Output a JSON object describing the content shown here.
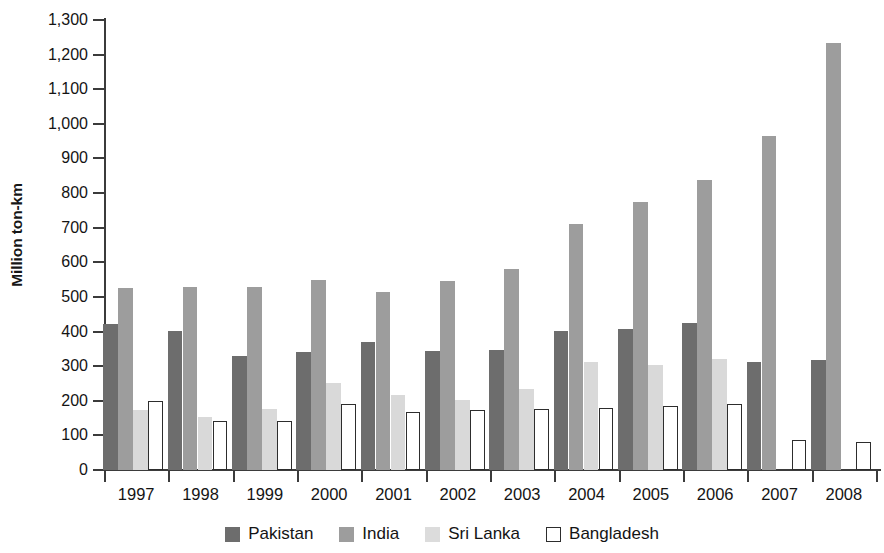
{
  "chart_data": {
    "type": "bar",
    "title": "",
    "subtitle": "",
    "xlabel": "",
    "ylabel": "Million ton-km",
    "categories": [
      "1997",
      "1998",
      "1999",
      "2000",
      "2001",
      "2002",
      "2003",
      "2004",
      "2005",
      "2006",
      "2007",
      "2008"
    ],
    "series": [
      {
        "name": "Pakistan",
        "color": "#6d6d6d",
        "values": [
          422,
          402,
          330,
          340,
          370,
          345,
          346,
          402,
          407,
          425,
          313,
          318
        ]
      },
      {
        "name": "India",
        "color": "#9d9d9d",
        "values": [
          525,
          528,
          530,
          548,
          513,
          545,
          581,
          710,
          773,
          838,
          965,
          1233
        ]
      },
      {
        "name": "Sri Lanka",
        "color": "#d9d9d9",
        "values": [
          172,
          152,
          175,
          250,
          217,
          202,
          235,
          311,
          303,
          322,
          null,
          null
        ]
      },
      {
        "name": "Bangladesh",
        "color": "#ffffff",
        "values": [
          200,
          143,
          142,
          192,
          168,
          172,
          175,
          180,
          184,
          191,
          88,
          82
        ]
      }
    ],
    "ylim": [
      0,
      1300
    ],
    "y_ticks": [
      0,
      100,
      200,
      300,
      400,
      500,
      600,
      700,
      800,
      900,
      1000,
      1100,
      1200,
      1300
    ],
    "y_tick_labels": [
      "0",
      "100",
      "200",
      "300",
      "400",
      "500",
      "600",
      "700",
      "800",
      "900",
      "1,000",
      "1,100",
      "1,200",
      "1,300"
    ],
    "grid": false,
    "legend_position": "bottom"
  },
  "legend": {
    "items": [
      {
        "label": "Pakistan",
        "key": "pakistan"
      },
      {
        "label": "India",
        "key": "india"
      },
      {
        "label": "Sri Lanka",
        "key": "srilanka"
      },
      {
        "label": "Bangladesh",
        "key": "bangladesh"
      }
    ]
  },
  "colors": {
    "pakistan": "#6d6d6d",
    "india": "#9d9d9d",
    "srilanka": "#d9d9d9",
    "bangladesh": "#ffffff",
    "axis": "#3b3b3b",
    "text": "#141414"
  }
}
